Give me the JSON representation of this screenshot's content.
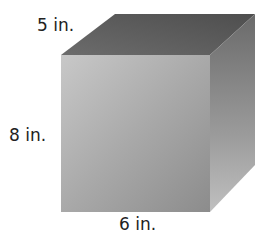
{
  "figure": {
    "shape": "rectangular prism",
    "labels": {
      "depth": "5 in.",
      "height": "8 in.",
      "width": "6 in."
    },
    "colors": {
      "front_light": "#c4c4c4",
      "front_dark": "#8e8e8e",
      "top": "#5a5a5a",
      "side_dark": "#6a6a6a",
      "side_light": "#b5b5b5"
    }
  }
}
